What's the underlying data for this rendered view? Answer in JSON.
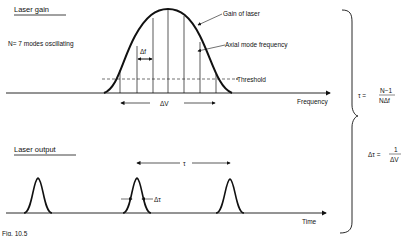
{
  "gain_panel": {
    "title": "Laser gain",
    "modes_note": "N= 7 modes oscillating",
    "gain_label": "Gain of laser",
    "axial_label": "Axial mode frequency",
    "threshold_label": "Threshold",
    "x_axis_label": "Frequency",
    "delta_f": "Δf",
    "delta_nu": "ΔV",
    "mode_count": 7
  },
  "output_panel": {
    "title": "Laser output",
    "tau": "τ",
    "delta_tau": "Δτ",
    "x_axis_label": "Time"
  },
  "equations": {
    "tau_lhs": "τ =",
    "tau_num": "N−1",
    "tau_den": "NΔf",
    "dtau_lhs": "Δτ =",
    "dtau_num": "1",
    "dtau_den": "ΔV"
  },
  "caption": "Fig. 10.5"
}
